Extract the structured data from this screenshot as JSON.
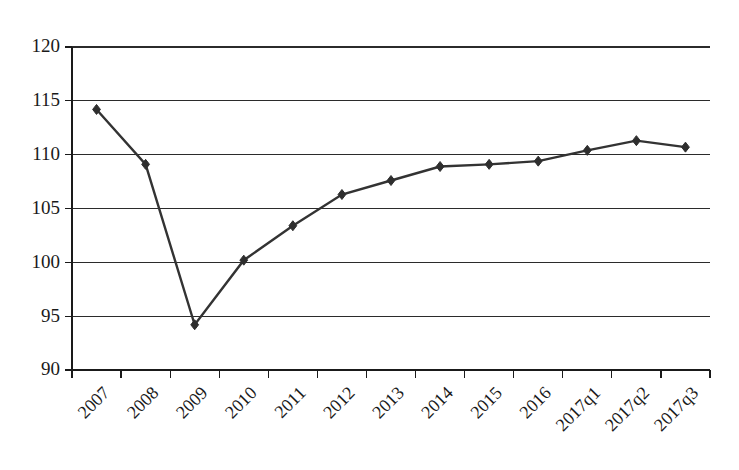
{
  "chart_data": {
    "type": "line",
    "title": "",
    "subtitle": "",
    "xlabel": "",
    "ylabel": "",
    "categories": [
      "2007",
      "2008",
      "2009",
      "2010",
      "2011",
      "2012",
      "2013",
      "2014",
      "2015",
      "2016",
      "2017q1",
      "2017q2",
      "2017q3"
    ],
    "values": [
      114.2,
      109.1,
      94.2,
      100.2,
      103.4,
      106.3,
      107.6,
      108.9,
      109.1,
      109.4,
      110.4,
      111.3,
      110.7
    ],
    "series": [
      {
        "name": "",
        "values": [
          114.2,
          109.1,
          94.2,
          100.2,
          103.4,
          106.3,
          107.6,
          108.9,
          109.1,
          109.4,
          110.4,
          111.3,
          110.7
        ]
      }
    ],
    "ylim": [
      90,
      120
    ],
    "yticks": [
      90,
      95,
      100,
      105,
      110,
      115,
      120
    ],
    "ytick_labels": [
      "90",
      "95",
      "100",
      "105",
      "110",
      "115",
      "120"
    ],
    "grid": true,
    "grid_axis": "y",
    "legend": false,
    "legend_position": "none",
    "marker": "diamond",
    "line_color": "#333333",
    "marker_color": "#2e2e2e",
    "grid_color": "#2b2b2b",
    "axis_color": "#1a1a1a",
    "background_color": "#ffffff",
    "xtick_rotation": 45
  },
  "plot_geometry": {
    "left": 72,
    "right": 710,
    "top": 47,
    "bottom": 370
  }
}
